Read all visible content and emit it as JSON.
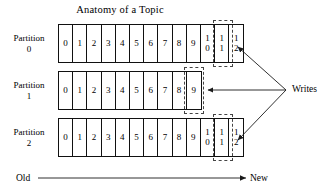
{
  "diagram": {
    "title": "Anatomy of a Topic",
    "partitions": [
      {
        "label": "Partition",
        "number": "0",
        "cells": [
          "0",
          "1",
          "2",
          "3",
          "4",
          "5",
          "6",
          "7",
          "8",
          "9",
          "10",
          "11",
          "12"
        ],
        "highlighted_cells": [
          "12"
        ]
      },
      {
        "label": "Partition",
        "number": "1",
        "cells": [
          "0",
          "1",
          "2",
          "3",
          "4",
          "5",
          "6",
          "7",
          "8",
          "9"
        ],
        "highlighted_cells": [
          "9"
        ]
      },
      {
        "label": "Partition",
        "number": "2",
        "cells": [
          "0",
          "1",
          "2",
          "3",
          "4",
          "5",
          "6",
          "7",
          "8",
          "9",
          "10",
          "11",
          "12"
        ],
        "highlighted_cells": [
          "12"
        ]
      }
    ],
    "writes_label": "Writes",
    "axis": {
      "old_label": "Old",
      "new_label": "New"
    },
    "colors": {
      "stroke": "#111111",
      "dashed_stroke": "#444444",
      "background": "#ffffff",
      "text": "#000000"
    }
  }
}
